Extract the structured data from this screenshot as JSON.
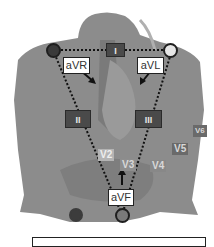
{
  "diagram": {
    "title": "",
    "colors": {
      "body": "#8a8a8a",
      "body_light": "#a0a0a0",
      "lead_box": "#4a4a4a",
      "label_box": "#ffffff",
      "electrode_ra": "#3a3a3a",
      "electrode_la": "#e6e6e6",
      "electrode_ll": "#7a7a7a",
      "electrode_rl": "#3c3c3c"
    },
    "limb_leads": [
      {
        "id": "I",
        "label": "I"
      },
      {
        "id": "II",
        "label": "II"
      },
      {
        "id": "III",
        "label": "III"
      }
    ],
    "augmented_leads": [
      {
        "id": "aVR",
        "label": "aVR"
      },
      {
        "id": "aVL",
        "label": "aVL"
      },
      {
        "id": "aVF",
        "label": "aVF"
      }
    ],
    "precordial_leads": [
      {
        "id": "V2",
        "label": "V2"
      },
      {
        "id": "V3",
        "label": "V3"
      },
      {
        "id": "V4",
        "label": "V4"
      },
      {
        "id": "V5",
        "label": "V5"
      },
      {
        "id": "V6",
        "label": "V6"
      }
    ],
    "electrodes": [
      {
        "id": "right-arm",
        "shade": "dark"
      },
      {
        "id": "left-arm",
        "shade": "light"
      },
      {
        "id": "left-leg",
        "shade": "medium"
      },
      {
        "id": "right-leg",
        "shade": "dark"
      }
    ]
  }
}
